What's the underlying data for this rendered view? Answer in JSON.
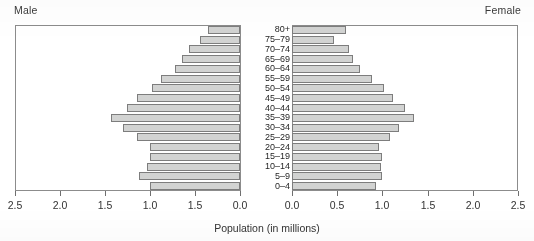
{
  "header": {
    "male_label": "Male",
    "female_label": "Female"
  },
  "axis": {
    "title": "Population (in millions)",
    "left_tick_labels": [
      "2.5",
      "2.0",
      "1.5",
      "1.0",
      "1.5",
      "0.0"
    ],
    "right_tick_labels": [
      "0.0",
      "0.5",
      "1.0",
      "1.5",
      "2.0",
      "2.5"
    ]
  },
  "chart_data": {
    "type": "bar",
    "title": "",
    "subtitle": "",
    "xlabel": "Population (in millions)",
    "ylabel": "",
    "orientation": "horizontal",
    "layout": "population-pyramid",
    "grid": false,
    "legend": "none",
    "xlim_left": [
      2.5,
      0.0
    ],
    "xlim_right": [
      0.0,
      2.5
    ],
    "categories": [
      "80+",
      "75–79",
      "70–74",
      "65–69",
      "60–64",
      "55–59",
      "50–54",
      "45–49",
      "40–44",
      "35–39",
      "30–34",
      "25–29",
      "20–24",
      "15–19",
      "10–14",
      "5–9",
      "0–4"
    ],
    "series": [
      {
        "name": "Male",
        "side": "left",
        "values": [
          0.36,
          0.44,
          0.57,
          0.64,
          0.72,
          0.88,
          0.98,
          1.14,
          1.26,
          1.43,
          1.3,
          1.14,
          1.0,
          1.0,
          1.03,
          1.12,
          1.0
        ]
      },
      {
        "name": "Female",
        "side": "right",
        "values": [
          0.6,
          0.46,
          0.63,
          0.68,
          0.75,
          0.88,
          1.02,
          1.12,
          1.25,
          1.35,
          1.18,
          1.08,
          0.96,
          1.0,
          0.98,
          1.0,
          0.93
        ]
      }
    ]
  },
  "style": {
    "bar_fill": "#d2d3d2",
    "bar_stroke": "#7d7d7d",
    "axis_color": "#8c8c8c",
    "text_color": "#2b2b2b"
  }
}
